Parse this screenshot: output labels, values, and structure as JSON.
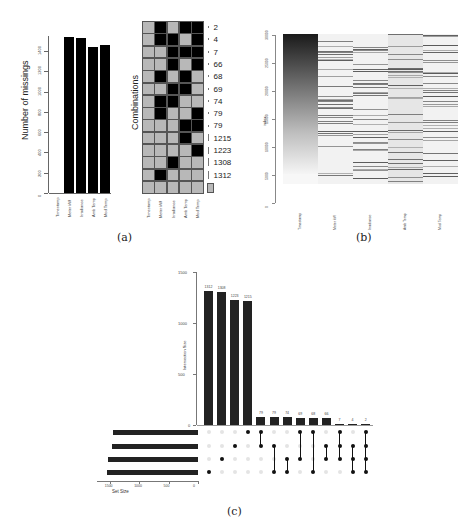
{
  "captions": {
    "a": "(a)",
    "b": "(b)",
    "c": "(c)"
  },
  "chart_data": [
    {
      "id": "a-left",
      "type": "bar",
      "title": "",
      "xlabel": "",
      "ylabel": "Number of missings",
      "categories": [
        "Timestamp",
        "Meter kW",
        "Irradiance",
        "Amb Temp",
        "Mod Temp"
      ],
      "values": [
        0,
        1540,
        1530,
        1440,
        1460
      ],
      "yticks": [
        "0",
        "200",
        "400",
        "600",
        "800",
        "1000",
        "1200",
        "1400"
      ],
      "ylim": [
        0,
        1550
      ]
    },
    {
      "id": "a-right",
      "type": "heatmap",
      "title": "",
      "ylabel": "Combinations",
      "columns": [
        "Timestamp",
        "Meter kW",
        "Irradiance",
        "Amb Temp",
        "Mod Temp"
      ],
      "rows": [
        {
          "count": "2",
          "missing": [
            0,
            1,
            0,
            1,
            1
          ]
        },
        {
          "count": "4",
          "missing": [
            0,
            1,
            1,
            0,
            1
          ]
        },
        {
          "count": "7",
          "missing": [
            0,
            0,
            1,
            1,
            1
          ]
        },
        {
          "count": "66",
          "missing": [
            0,
            0,
            1,
            0,
            1
          ]
        },
        {
          "count": "68",
          "missing": [
            0,
            1,
            0,
            1,
            0
          ]
        },
        {
          "count": "69",
          "missing": [
            0,
            0,
            1,
            1,
            0
          ]
        },
        {
          "count": "74",
          "missing": [
            0,
            1,
            1,
            0,
            0
          ]
        },
        {
          "count": "79",
          "missing": [
            0,
            1,
            0,
            0,
            1
          ]
        },
        {
          "count": "79",
          "missing": [
            0,
            0,
            0,
            1,
            1
          ]
        },
        {
          "count": "1215",
          "missing": [
            0,
            0,
            0,
            1,
            0
          ]
        },
        {
          "count": "1223",
          "missing": [
            0,
            0,
            0,
            0,
            1
          ]
        },
        {
          "count": "1308",
          "missing": [
            0,
            0,
            1,
            0,
            0
          ]
        },
        {
          "count": "1312",
          "missing": [
            0,
            1,
            0,
            0,
            0
          ]
        },
        {
          "count": "",
          "missing": [
            0,
            0,
            0,
            0,
            0
          ]
        }
      ]
    },
    {
      "id": "b",
      "type": "heatmap",
      "title": "",
      "ylabel": "index",
      "yticks": [
        "0",
        "5000",
        "10000",
        "15000",
        "20000",
        "25000",
        "30000"
      ],
      "columns": [
        "Timestamp",
        "Meter kW",
        "Irradiance",
        "Amb Temp",
        "Mod Temp"
      ],
      "note": "Timestamp column shows a gradient (dark at top, light at bottom); other columns show sparse gray stripes marking missing values"
    },
    {
      "id": "c",
      "type": "bar",
      "title": "",
      "ylabel": "Intersection Size",
      "yticks": [
        "0",
        "500",
        "1000",
        "1500"
      ],
      "ylim": [
        0,
        1500
      ],
      "values": [
        1312,
        1308,
        1223,
        1215,
        79,
        79,
        74,
        69,
        68,
        66,
        7,
        4,
        2
      ],
      "value_labels": [
        "1312",
        "1308",
        "1223",
        "1215",
        "79",
        "79",
        "74",
        "69",
        "68",
        "66",
        "7",
        "4",
        "2"
      ],
      "sets": [
        "Amb.Temp_NA",
        "Mod.Temp_NA",
        "Irradiance_NA",
        "Meter.kW_NA"
      ],
      "set_sizes": [
        1440,
        1460,
        1530,
        1540
      ],
      "set_size_xlabel": "Set Size",
      "set_size_ticks": [
        "1500",
        "1000",
        "500",
        "0"
      ],
      "matrix": [
        [
          3
        ],
        [
          2
        ],
        [
          1
        ],
        [
          0
        ],
        [
          0,
          1
        ],
        [
          1,
          3
        ],
        [
          2,
          3
        ],
        [
          0,
          2
        ],
        [
          0,
          3
        ],
        [
          1,
          2
        ],
        [
          0,
          1,
          2
        ],
        [
          1,
          2,
          3
        ],
        [
          0,
          1,
          2,
          3
        ]
      ]
    }
  ]
}
